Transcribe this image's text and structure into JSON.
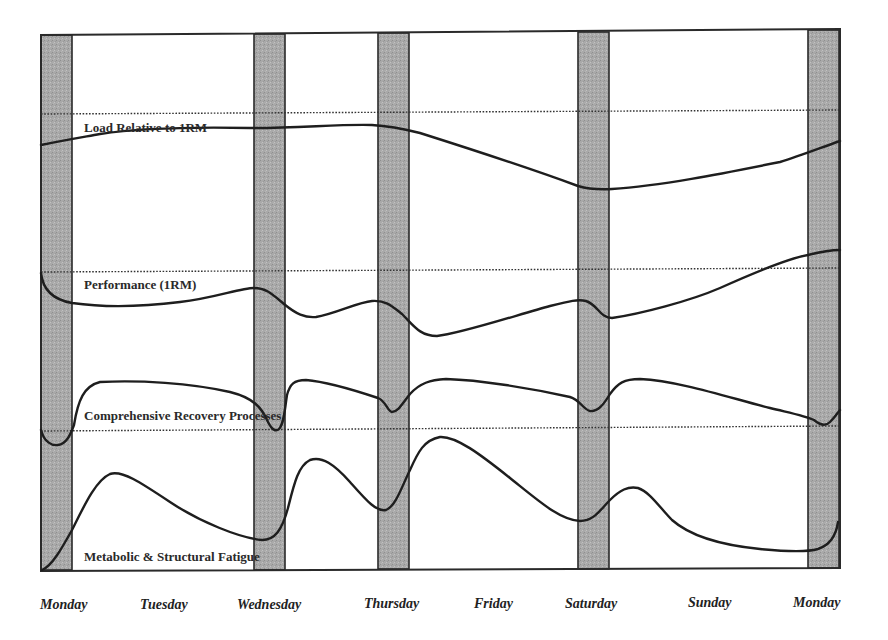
{
  "chart_data": {
    "type": "line",
    "title": "",
    "xlabel": "",
    "ylabel": "",
    "grid": false,
    "legend": "inline labels above each reference line",
    "categories": [
      "Monday",
      "Tuesday",
      "Wednesday",
      "Thursday",
      "Friday",
      "Saturday",
      "Sunday",
      "Monday"
    ],
    "training_days": [
      "Monday",
      "Wednesday",
      "Thursday",
      "Saturday",
      "Monday"
    ],
    "colors": {
      "band_fill": "#a8a8a8",
      "band_stroke": "#2a2a2a",
      "curve": "#1e1e1e",
      "reference_line": "#333333"
    },
    "series": [
      {
        "name": "Load Relative to 1RM",
        "label_pos": [
          84,
          132
        ],
        "reference_y": 113,
        "path": "M41,145 C60,141 72,139 100,134 C140,128 200,127 250,128 C300,128 340,124 372,125 C390,126 400,128 420,133 C480,152 540,172 578,186 C588,189 596,190 612,189 C660,186 720,174 780,162 C800,156 820,148 840,141"
      },
      {
        "name": "Performance (1RM)",
        "label_pos": [
          84,
          289
        ],
        "reference_y": 271,
        "path": "M41,273 C43,292 55,300 72,303 C100,307 140,307 180,302 C215,298 240,288 254,288 C266,288 272,294 284,304 C296,314 305,318 316,317 C335,314 358,302 372,301 C386,300 392,306 402,314 C414,326 420,336 437,336 C460,334 520,314 550,306 C570,301 578,299 586,301 C598,305 600,318 612,318 C640,314 690,301 720,288 C760,270 790,258 808,255 C820,252 830,250 840,250"
      },
      {
        "name": "Comprehensive Recovery Processes",
        "label_pos": [
          84,
          420
        ],
        "reference_y": 430,
        "path": "M41,430 C44,442 52,446 58,445 C66,444 70,436 74,425 C78,400 84,386 100,382 C140,380 190,383 230,392 C254,398 262,408 268,422 C272,430 276,432 279,429 C284,424 285,408 287,395 C290,384 294,380 306,380 C330,382 360,392 378,398 C386,401 388,412 392,412 C398,412 402,404 410,394 C420,383 430,380 446,379 C480,380 530,388 570,397 C580,400 584,410 590,411 C598,412 604,404 610,394 C618,383 624,379 640,379 C680,381 730,398 770,408 C795,414 806,416 814,420 C820,425 826,426 830,422 C836,416 838,412 840,410"
      },
      {
        "name": "Metabolic & Structural Fatigue",
        "label_pos": [
          84,
          561
        ],
        "reference_y": null,
        "path": "M42,570 C52,566 62,548 72,530 C84,506 96,480 110,474 C122,470 140,482 170,502 C200,522 240,538 262,540 C275,540 282,530 288,508 C294,484 298,466 310,460 C322,456 334,464 350,482 C366,500 376,512 386,510 C396,506 402,486 410,470 C418,452 424,440 440,437 C456,436 480,454 510,478 C540,502 560,520 580,521 C594,521 600,510 610,500 C620,490 628,486 638,488 C650,492 660,508 672,520 C690,536 720,545 760,549 C790,552 808,552 818,549 C830,545 836,536 838,522"
      }
    ]
  },
  "bands": [
    {
      "day": "Monday",
      "x": 41,
      "width": 31
    },
    {
      "day": "Wednesday",
      "x": 254,
      "width": 31
    },
    {
      "day": "Thursday",
      "x": 378,
      "width": 31
    },
    {
      "day": "Saturday",
      "x": 578,
      "width": 31
    },
    {
      "day": "Monday",
      "x": 808,
      "width": 31
    }
  ],
  "x_axis": {
    "labels": [
      {
        "text": "Monday",
        "x": 40
      },
      {
        "text": "Tuesday",
        "x": 140
      },
      {
        "text": "Wednesday",
        "x": 237
      },
      {
        "text": "Thursday",
        "x": 364
      },
      {
        "text": "Friday",
        "x": 474
      },
      {
        "text": "Saturday",
        "x": 565
      },
      {
        "text": "Sunday",
        "x": 688
      },
      {
        "text": "Monday",
        "x": 793
      }
    ]
  }
}
